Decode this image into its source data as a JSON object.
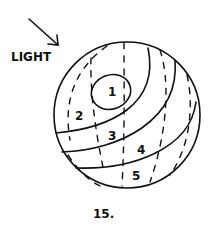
{
  "figure": {
    "light_label": "LIGHT",
    "caption": "15.",
    "zones": [
      {
        "id": 1,
        "label": "1"
      },
      {
        "id": 2,
        "label": "2"
      },
      {
        "id": 3,
        "label": "3"
      },
      {
        "id": 4,
        "label": "4"
      },
      {
        "id": 5,
        "label": "5"
      }
    ],
    "ink_color": "#111111",
    "background": "#ffffff"
  }
}
